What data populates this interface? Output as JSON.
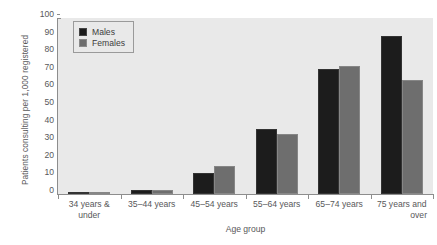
{
  "chart_data": {
    "type": "bar",
    "title": "",
    "xlabel": "Age group",
    "ylabel": "Patients consulting per 1,000 registered",
    "ylim": [
      0,
      100
    ],
    "yticks": [
      0,
      10,
      20,
      30,
      40,
      50,
      60,
      70,
      80,
      90,
      100
    ],
    "grid": false,
    "legend_position": "top-left",
    "categories": [
      "34 years &\nunder",
      "35–44 years",
      "45–54 years",
      "55–64 years",
      "65–74 years",
      "75 years and\nover"
    ],
    "series": [
      {
        "name": "Males",
        "color": "#1c1c1c",
        "values": [
          1,
          2,
          12,
          37,
          71,
          90
        ]
      },
      {
        "name": "Females",
        "color": "#6e6e6e",
        "values": [
          1,
          2,
          16,
          34,
          73,
          65
        ]
      }
    ]
  },
  "x_labels": [
    {
      "line1": "34 years &",
      "line2": "under"
    },
    {
      "line1": "35–44 years",
      "line2": ""
    },
    {
      "line1": "45–54 years",
      "line2": ""
    },
    {
      "line1": "55–64 years",
      "line2": ""
    },
    {
      "line1": "65–74 years",
      "line2": ""
    },
    {
      "line1": "75 years and",
      "line2": "over"
    }
  ],
  "colors": {
    "males": "#1c1c1c",
    "females": "#6e6e6e",
    "plot_background": "#e9e9e9",
    "axis": "#8d8d8d",
    "text": "#58585a"
  }
}
